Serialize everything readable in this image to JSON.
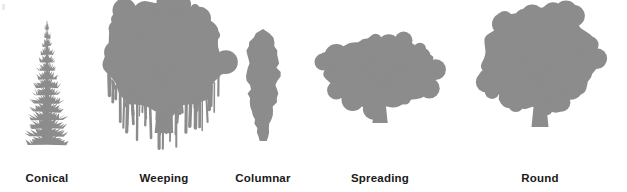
{
  "figure": {
    "width": 627,
    "height": 192,
    "background_color": "#ffffff",
    "silhouette_color": "#8c8c8c",
    "label_color": "#1a1a1a",
    "ground_line_y": 157
  },
  "chart_data": {
    "type": "diagram",
    "categories": [
      "Conical",
      "Weeping",
      "Columnar",
      "Spreading",
      "Round"
    ],
    "legend_position": "below-each-item",
    "grid": false
  },
  "trees": [
    {
      "label": "Conical",
      "shape": "conical",
      "icon": "conical-tree-icon",
      "center_x": 47,
      "crown_width": 46,
      "crown_height": 118,
      "crown_top_y": 32,
      "trunk_width": 4,
      "trunk_height": 12,
      "seed": 11
    },
    {
      "label": "Weeping",
      "shape": "weeping",
      "icon": "weeping-tree-icon",
      "center_x": 164,
      "crown_width": 126,
      "crown_height": 132,
      "crown_top_y": 18,
      "trunk_width": 11,
      "trunk_height": 18,
      "seed": 23
    },
    {
      "label": "Columnar",
      "shape": "columnar",
      "icon": "columnar-tree-icon",
      "center_x": 263,
      "crown_width": 30,
      "crown_height": 112,
      "crown_top_y": 38,
      "trunk_width": 5,
      "trunk_height": 10,
      "seed": 37
    },
    {
      "label": "Spreading",
      "shape": "spreading",
      "icon": "spreading-tree-icon",
      "center_x": 380,
      "crown_width": 118,
      "crown_height": 92,
      "crown_top_y": 42,
      "trunk_width": 9,
      "trunk_height": 28,
      "seed": 53
    },
    {
      "label": "Round",
      "shape": "round",
      "icon": "round-tree-icon",
      "center_x": 540,
      "crown_width": 122,
      "crown_height": 118,
      "crown_top_y": 22,
      "trunk_width": 10,
      "trunk_height": 24,
      "seed": 71
    }
  ]
}
